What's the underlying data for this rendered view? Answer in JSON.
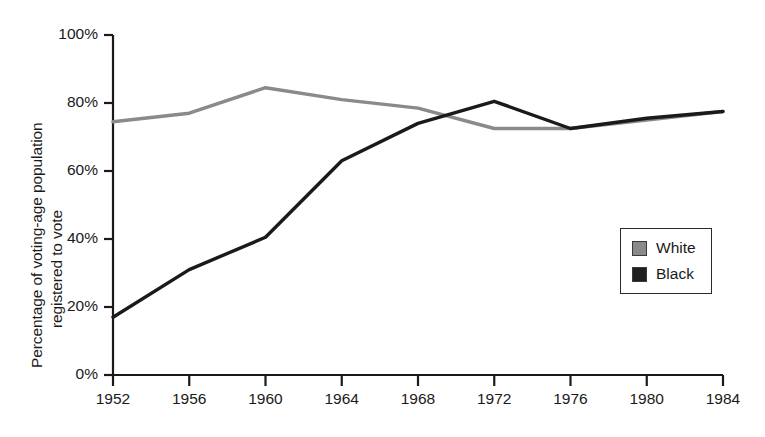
{
  "chart_data": {
    "type": "line",
    "title": "",
    "xlabel": "",
    "ylabel": "Percentage of voting-age population registered to vote",
    "ylabel_line1": "Percentage of voting-age population",
    "ylabel_line2": "registered to vote",
    "x": [
      1952,
      1956,
      1960,
      1964,
      1968,
      1972,
      1976,
      1980,
      1984
    ],
    "xticklabels": [
      "1952",
      "1956",
      "1960",
      "1964",
      "1968",
      "1972",
      "1976",
      "1980",
      "1984"
    ],
    "yticks": [
      0,
      20,
      40,
      60,
      80,
      100
    ],
    "yticklabels": [
      "0%",
      "20%",
      "40%",
      "60%",
      "80%",
      "100%"
    ],
    "xlim": [
      1952,
      1984
    ],
    "ylim": [
      0,
      100
    ],
    "grid": false,
    "legend_position": "center-right",
    "series": [
      {
        "name": "White",
        "color": "#8a8a8a",
        "values": [
          74.5,
          77.0,
          84.5,
          81.0,
          78.5,
          72.5,
          72.5,
          75.0,
          77.5
        ]
      },
      {
        "name": "Black",
        "color": "#1a1a1a",
        "values": [
          17.0,
          31.0,
          40.5,
          63.0,
          74.0,
          80.5,
          72.5,
          75.5,
          77.5
        ]
      }
    ]
  },
  "legend": {
    "items": [
      {
        "label": "White",
        "swatch_color": "#8a8a8a"
      },
      {
        "label": "Black",
        "swatch_color": "#1f1f1f"
      }
    ]
  },
  "axis": {
    "color": "#1a1a1a"
  }
}
